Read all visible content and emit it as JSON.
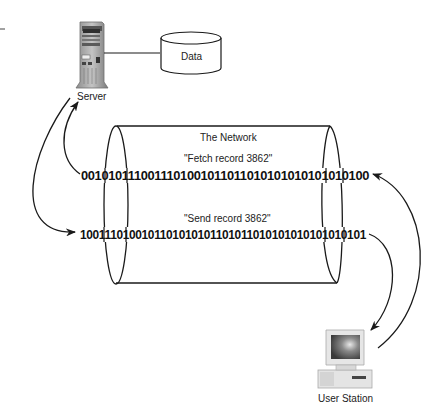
{
  "server": {
    "label": "Server",
    "icon": "server-tower-icon"
  },
  "database": {
    "label": "Data",
    "icon": "database-cylinder-icon"
  },
  "network": {
    "title": "The Network",
    "request": {
      "caption": "\"Fetch record 3862\"",
      "bits": "0010101110011101001011011010101010101010100",
      "direction": "user-station-to-server"
    },
    "response": {
      "caption": "\"Send record 3862\"",
      "bits": "1001110100101101010101101011010101010101010101",
      "direction": "server-to-user-station"
    }
  },
  "user_station": {
    "label": "User Station",
    "icon": "desktop-computer-icon"
  },
  "colors": {
    "line": "#1a1a1a",
    "text": "#222222",
    "device_gray": "#9a9a9a"
  }
}
